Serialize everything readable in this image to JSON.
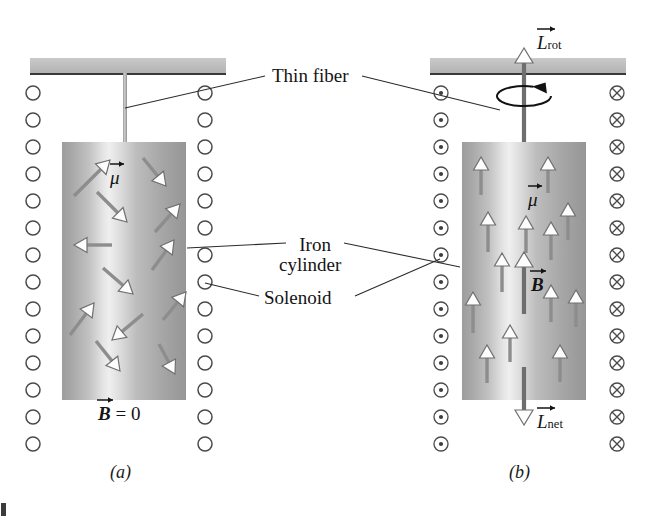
{
  "figure": {
    "background": "#ffffff",
    "width": 651,
    "height": 518
  },
  "callouts": {
    "thin_fiber": "Thin fiber",
    "iron_cylinder_line1": "Iron",
    "iron_cylinder_line2": "cylinder",
    "solenoid": "Solenoid"
  },
  "panels": [
    {
      "id": "a",
      "tag": "(a)",
      "description": "Solenoid off: magnetic dipole moments randomly oriented, no net field",
      "field_label": "B",
      "field_value": "= 0",
      "dipole_label": "μ",
      "current_symbol": "open-circle",
      "cylinder": {
        "x": 62,
        "y": 142,
        "w": 124,
        "h": 258
      },
      "support_bar": {
        "x": 30,
        "y": 58,
        "w": 196,
        "h": 15
      },
      "fiber": {
        "x": 123,
        "y": 73,
        "w": 4,
        "h": 69
      },
      "coil_left_x": 33,
      "coil_right_x": 205,
      "coil_top_y": 93,
      "coil_count": 14,
      "coil_spacing": 27,
      "coil_radius": 7,
      "dipoles": [
        {
          "x1": 74,
          "y1": 196,
          "x2": 110,
          "y2": 160,
          "angle": -45
        },
        {
          "x1": 143,
          "y1": 158,
          "x2": 166,
          "y2": 186,
          "angle": 50
        },
        {
          "x1": 97,
          "y1": 192,
          "x2": 127,
          "y2": 222,
          "angle": 45
        },
        {
          "x1": 155,
          "y1": 232,
          "x2": 180,
          "y2": 204,
          "angle": -48
        },
        {
          "x1": 112,
          "y1": 245,
          "x2": 74,
          "y2": 245,
          "angle": 180
        },
        {
          "x1": 152,
          "y1": 270,
          "x2": 174,
          "y2": 240,
          "angle": -54
        },
        {
          "x1": 103,
          "y1": 268,
          "x2": 133,
          "y2": 294,
          "angle": 41
        },
        {
          "x1": 70,
          "y1": 335,
          "x2": 94,
          "y2": 303,
          "angle": -53
        },
        {
          "x1": 163,
          "y1": 320,
          "x2": 186,
          "y2": 292,
          "angle": -51
        },
        {
          "x1": 143,
          "y1": 314,
          "x2": 112,
          "y2": 340,
          "angle": 140
        },
        {
          "x1": 96,
          "y1": 341,
          "x2": 120,
          "y2": 371,
          "angle": 51
        },
        {
          "x1": 159,
          "y1": 344,
          "x2": 175,
          "y2": 374,
          "angle": 62
        }
      ]
    },
    {
      "id": "b",
      "tag": "(b)",
      "description": "Solenoid on: dipoles aligned with B, cylinder rotates",
      "field_label": "B",
      "dipole_label": "μ",
      "angular_momentum_rot": "L",
      "angular_momentum_rot_sub": "rot",
      "angular_momentum_net": "L",
      "angular_momentum_net_sub": "net",
      "current_symbol_left": "dotted-circle",
      "current_symbol_right": "crossed-circle",
      "cylinder": {
        "x": 462,
        "y": 142,
        "w": 124,
        "h": 258
      },
      "support_bar": {
        "x": 430,
        "y": 58,
        "w": 196,
        "h": 15
      },
      "fiber": {
        "x": 522,
        "y": 73,
        "w": 4,
        "h": 69
      },
      "coil_left_x": 441,
      "coil_right_x": 617,
      "coil_top_y": 93,
      "coil_count": 14,
      "coil_spacing": 27,
      "coil_radius": 7,
      "rotation_arrow": {
        "cx": 524,
        "cy": 96,
        "rx": 27,
        "ry": 10
      },
      "dipoles": [
        {
          "x": 481,
          "y_top": 157,
          "y_bot": 195
        },
        {
          "x": 548,
          "y_top": 157,
          "y_bot": 193
        },
        {
          "x": 488,
          "y_top": 212,
          "y_bot": 252
        },
        {
          "x": 526,
          "y_top": 216,
          "y_bot": 253
        },
        {
          "x": 551,
          "y_top": 222,
          "y_bot": 260
        },
        {
          "x": 568,
          "y_top": 203,
          "y_bot": 240
        },
        {
          "x": 502,
          "y_top": 253,
          "y_bot": 292
        },
        {
          "x": 473,
          "y_top": 292,
          "y_bot": 333
        },
        {
          "x": 551,
          "y_top": 285,
          "y_bot": 322
        },
        {
          "x": 576,
          "y_top": 290,
          "y_bot": 327
        },
        {
          "x": 510,
          "y_top": 325,
          "y_bot": 362
        },
        {
          "x": 487,
          "y_top": 345,
          "y_bot": 383
        },
        {
          "x": 560,
          "y_top": 345,
          "y_bot": 382
        }
      ],
      "b_arrow": {
        "x": 524,
        "y_top": 252,
        "y_bot": 314
      },
      "net_arrow": {
        "x": 524,
        "y_top": 367,
        "y_bot": 425
      }
    }
  ],
  "colors": {
    "support_bar": "#bdbdbd",
    "cylinder_light": "#efefef",
    "cylinder_dark": "#9a9a9a",
    "arrow_shaft": "#8d8d8d",
    "arrow_head_fill": "#fdfdfd",
    "line": "#2b2b2b",
    "text": "#141414"
  }
}
